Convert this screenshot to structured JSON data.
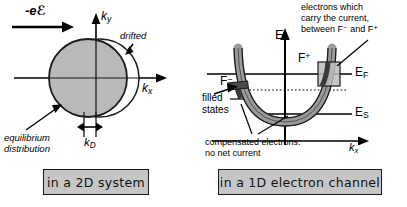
{
  "panel_2d": {
    "field_label_prefix": "-e",
    "field_label_symbol": "ℰ",
    "axis_ky": "k",
    "axis_ky_sub": "y",
    "axis_kx": "k",
    "axis_kx_sub": "x",
    "drifted_label": "drifted",
    "equilibrium_label_line1": "equilibrium",
    "equilibrium_label_line2": "distribution",
    "kd_label": "k",
    "kd_label_sub": "D",
    "caption": "in a 2D system",
    "colors": {
      "equilibrium_fill": "#b9b9b9",
      "outline": "#000000",
      "drifted_fill": "#ffffff",
      "caption_fill": "#c6c6c6"
    }
  },
  "panel_1d": {
    "axis_E": "E",
    "axis_kx": "k",
    "axis_kx_sub": "x",
    "level_EF": "E",
    "level_EF_sub": "F",
    "level_ES": "E",
    "level_ES_sub": "S",
    "label_Fplus": "F",
    "label_Fplus_sup": "+",
    "label_Fminus": "F",
    "label_Fminus_sup": "−",
    "annotation_top_line1": "electrons which",
    "annotation_top_line2": "carry the current,",
    "annotation_top_line3": "between F⁻ and F⁺",
    "filled_states_line1": "filled",
    "filled_states_line2": "states",
    "annotation_bottom_line1": "compensated electrons:",
    "annotation_bottom_line2": "no net current",
    "caption": "in a 1D electron channel",
    "colors": {
      "band_fill": "#9a9a9a",
      "band_stroke": "#000000",
      "box_fill": "#bdbdbd",
      "caption_fill": "#c6c6c6"
    }
  }
}
